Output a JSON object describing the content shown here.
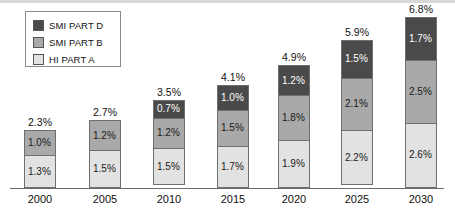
{
  "legend": {
    "items": [
      {
        "label": "SMI PART D",
        "color": "#4a4a4a",
        "key": "smi_part_d"
      },
      {
        "label": "SMI PART B",
        "color": "#a9a9a9",
        "key": "smi_part_b"
      },
      {
        "label": "HI PART A",
        "color": "#e2e2e2",
        "key": "hi_part_a"
      }
    ]
  },
  "chart_data": {
    "type": "bar",
    "subtype": "stacked-bar",
    "title": "",
    "xlabel": "",
    "ylabel": "",
    "grid": false,
    "legend_position": "top-left",
    "axis": {
      "visible_axis": "x-baseline-only",
      "ylim": [
        0,
        6.8
      ],
      "unit": "%"
    },
    "categories": [
      "2000",
      "2005",
      "2010",
      "2015",
      "2020",
      "2025",
      "2030"
    ],
    "series": [
      {
        "name": "HI PART A",
        "color": "#e2e2e2",
        "values": [
          1.3,
          1.5,
          1.5,
          1.7,
          1.9,
          2.2,
          2.6
        ],
        "labels": [
          "1.3%",
          "1.5%",
          "1.5%",
          "1.7%",
          "1.9%",
          "2.2%",
          "2.6%"
        ]
      },
      {
        "name": "SMI PART B",
        "color": "#a9a9a9",
        "values": [
          1.0,
          1.2,
          1.2,
          1.5,
          1.8,
          2.1,
          2.5
        ],
        "labels": [
          "1.0%",
          "1.2%",
          "1.2%",
          "1.5%",
          "1.8%",
          "2.1%",
          "2.5%"
        ]
      },
      {
        "name": "SMI PART D",
        "color": "#4a4a4a",
        "values": [
          0,
          0,
          0.7,
          1.0,
          1.2,
          1.5,
          1.7
        ],
        "labels": [
          "",
          "",
          "0.7%",
          "1.0%",
          "1.2%",
          "1.5%",
          "1.7%"
        ]
      }
    ],
    "totals": [
      2.3,
      2.7,
      3.5,
      4.1,
      4.9,
      5.9,
      6.8
    ],
    "total_labels": [
      "2.3%",
      "2.7%",
      "3.5%",
      "4.1%",
      "4.9%",
      "5.9%",
      "6.8%"
    ]
  },
  "layout": {
    "px_per_unit": 25.1,
    "baseline_y": 188,
    "bar_width": 32,
    "bar_x": [
      24,
      89,
      153,
      217,
      278,
      341,
      405
    ]
  }
}
